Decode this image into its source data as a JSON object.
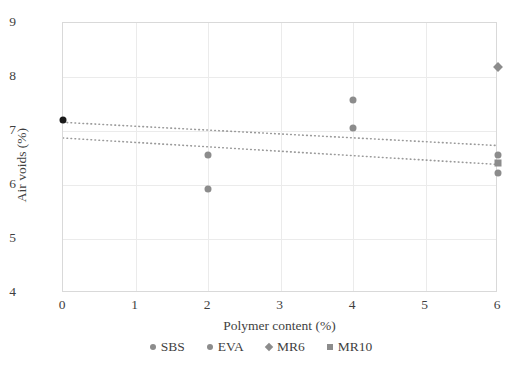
{
  "chart_data": {
    "type": "scatter",
    "title": "",
    "xlabel": "Polymer content (%)",
    "ylabel": "Air voids (%)",
    "xlim": [
      0,
      6
    ],
    "ylim": [
      4,
      9
    ],
    "xticks": [
      "0",
      "1",
      "2",
      "3",
      "4",
      "5",
      "6"
    ],
    "yticks": [
      "4",
      "5",
      "6",
      "7",
      "8",
      "9"
    ],
    "grid": true,
    "legend_position": "bottom-center",
    "series": [
      {
        "name": "SBS",
        "marker": "circle",
        "color": "#8c8c8c",
        "points": [
          {
            "x": 0,
            "y": 7.2
          },
          {
            "x": 2,
            "y": 6.55
          },
          {
            "x": 4,
            "y": 7.58
          },
          {
            "x": 6,
            "y": 6.55
          }
        ]
      },
      {
        "name": "EVA",
        "marker": "circle",
        "color": "#8c8c8c",
        "points": [
          {
            "x": 0,
            "y": 7.2
          },
          {
            "x": 2,
            "y": 5.93
          },
          {
            "x": 4,
            "y": 7.05
          },
          {
            "x": 6,
            "y": 6.22
          }
        ]
      },
      {
        "name": "MR6",
        "marker": "diamond",
        "color": "#8c8c8c",
        "points": [
          {
            "x": 0,
            "y": 7.2
          },
          {
            "x": 6,
            "y": 8.18
          }
        ]
      },
      {
        "name": "MR10",
        "marker": "square",
        "color": "#8c8c8c",
        "points": [
          {
            "x": 0,
            "y": 7.2
          },
          {
            "x": 6,
            "y": 6.4
          }
        ]
      }
    ],
    "origin_point": {
      "x": 0,
      "y": 7.2,
      "color": "#1a1a1a",
      "marker": "circle"
    },
    "trendlines": [
      {
        "name": "trendline-upper",
        "x0": 0,
        "y0": 7.16,
        "x1": 6,
        "y1": 6.73,
        "style": "dotted",
        "color": "#9a9a9a"
      },
      {
        "name": "trendline-lower",
        "x0": 0,
        "y0": 6.87,
        "x1": 6,
        "y1": 6.38,
        "style": "dotted",
        "color": "#9a9a9a"
      }
    ]
  },
  "legend": {
    "items": [
      {
        "label": "SBS",
        "marker": "circle",
        "color": "#8c8c8c"
      },
      {
        "label": "EVA",
        "marker": "circle",
        "color": "#8c8c8c"
      },
      {
        "label": "MR6",
        "marker": "diamond",
        "color": "#8c8c8c"
      },
      {
        "label": "MR10",
        "marker": "square",
        "color": "#8c8c8c"
      }
    ]
  },
  "colors": {
    "axis": "#d9d9d9",
    "grid": "#ebebeb",
    "marker": "#8c8c8c",
    "dark_marker": "#1a1a1a",
    "text": "#3f3f3f",
    "background": "#ffffff"
  }
}
